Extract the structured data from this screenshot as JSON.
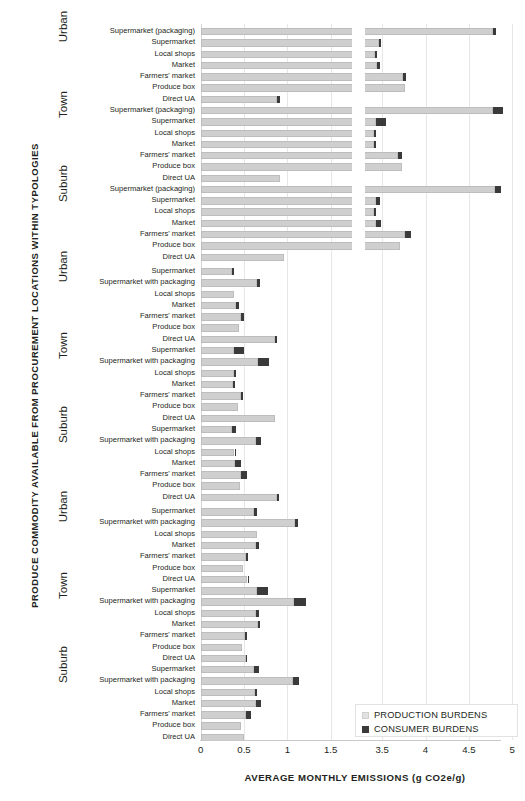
{
  "chart_data": {
    "type": "bar",
    "orientation": "horizontal",
    "title": "",
    "xlabel": "AVERAGE  MONTHLY  EMISSIONS (g CO2e/g)",
    "ylabel": "PRODUCE COMMODITY AVAILABLE FROM PROCUREMENT LOCATIONS WITHIN TYPOLOGIES",
    "grid": true,
    "legend_position": "bottom-right",
    "axis_break": {
      "from": 1.75,
      "to": 3.3
    },
    "xticks": [
      "0",
      "0.5",
      "1",
      "1.5",
      "3.5",
      "4",
      "4.5",
      "5"
    ],
    "xtick_values": [
      0,
      0.5,
      1,
      1.5,
      3.5,
      4,
      4.5,
      5
    ],
    "series": [
      {
        "name": "PRODUCTION BURDENS",
        "color": "#cfcfcf"
      },
      {
        "name": "CONSUMER BURDENS",
        "color": "#3a3a3a"
      }
    ],
    "groups": [
      {
        "commodity": "Tomato",
        "typologies": [
          {
            "name": "Urban",
            "rows": [
              {
                "label": "Supermarket (packaging)",
                "production": 4.78,
                "consumer": 0.03
              },
              {
                "label": "Supermarket",
                "production": 3.46,
                "consumer": 0.03
              },
              {
                "label": "Local shops",
                "production": 3.42,
                "consumer": 0.01
              },
              {
                "label": "Market",
                "production": 3.44,
                "consumer": 0.03
              },
              {
                "label": "Farmers' market",
                "production": 3.74,
                "consumer": 0.03
              },
              {
                "label": "Produce box",
                "production": 3.76,
                "consumer": 0.0
              },
              {
                "label": "Direct UA",
                "production": 0.88,
                "consumer": 0.03
              }
            ]
          },
          {
            "name": "Town",
            "rows": [
              {
                "label": "Supermarket (packaging)",
                "production": 4.78,
                "consumer": 0.12
              },
              {
                "label": "Supermarket",
                "production": 3.43,
                "consumer": 0.12
              },
              {
                "label": "Local shops",
                "production": 3.41,
                "consumer": 0.02
              },
              {
                "label": "Market",
                "production": 3.41,
                "consumer": 0.02
              },
              {
                "label": "Farmers' market",
                "production": 3.68,
                "consumer": 0.05
              },
              {
                "label": "Produce box",
                "production": 3.73,
                "consumer": 0.0
              },
              {
                "label": "Direct UA",
                "production": 0.92,
                "consumer": 0.0
              }
            ]
          },
          {
            "name": "Suburb",
            "rows": [
              {
                "label": "Supermarket (packaging)",
                "production": 4.8,
                "consumer": 0.07
              },
              {
                "label": "Supermarket",
                "production": 3.43,
                "consumer": 0.05
              },
              {
                "label": "Local shops",
                "production": 3.41,
                "consumer": 0.02
              },
              {
                "label": "Market",
                "production": 3.43,
                "consumer": 0.06
              },
              {
                "label": "Farmers' market",
                "production": 3.76,
                "consumer": 0.07
              },
              {
                "label": "Produce box",
                "production": 3.71,
                "consumer": 0.0
              },
              {
                "label": "Direct UA",
                "production": 0.96,
                "consumer": 0.0
              }
            ]
          }
        ]
      },
      {
        "commodity": "Potato",
        "typologies": [
          {
            "name": "Urban",
            "rows": [
              {
                "label": "Supermarket",
                "production": 0.36,
                "consumer": 0.03
              },
              {
                "label": "Supermarket with packaging",
                "production": 0.65,
                "consumer": 0.03
              },
              {
                "label": "Local shops",
                "production": 0.39,
                "consumer": 0.0
              },
              {
                "label": "Market",
                "production": 0.41,
                "consumer": 0.03
              },
              {
                "label": "Farmers' market",
                "production": 0.47,
                "consumer": 0.03
              },
              {
                "label": "Produce box",
                "production": 0.44,
                "consumer": 0.0
              },
              {
                "label": "Direct UA",
                "production": 0.86,
                "consumer": 0.02
              }
            ]
          },
          {
            "name": "Town",
            "rows": [
              {
                "label": "Supermarket",
                "production": 0.38,
                "consumer": 0.12
              },
              {
                "label": "Supermarket with packaging",
                "production": 0.66,
                "consumer": 0.13
              },
              {
                "label": "Local shops",
                "production": 0.38,
                "consumer": 0.03
              },
              {
                "label": "Market",
                "production": 0.37,
                "consumer": 0.03
              },
              {
                "label": "Farmers' market",
                "production": 0.46,
                "consumer": 0.03
              },
              {
                "label": "Produce box",
                "production": 0.43,
                "consumer": 0.0
              },
              {
                "label": "Direct UA",
                "production": 0.86,
                "consumer": 0.0
              }
            ]
          },
          {
            "name": "Suburb",
            "rows": [
              {
                "label": "Supermarket",
                "production": 0.36,
                "consumer": 0.05
              },
              {
                "label": "Supermarket with packaging",
                "production": 0.64,
                "consumer": 0.06
              },
              {
                "label": "Local shops",
                "production": 0.39,
                "consumer": 0.02
              },
              {
                "label": "Market",
                "production": 0.4,
                "consumer": 0.06
              },
              {
                "label": "Farmers' market",
                "production": 0.47,
                "consumer": 0.06
              },
              {
                "label": "Produce box",
                "production": 0.45,
                "consumer": 0.0
              },
              {
                "label": "Direct UA",
                "production": 0.88,
                "consumer": 0.02
              }
            ]
          }
        ]
      },
      {
        "commodity": "Apple",
        "typologies": [
          {
            "name": "Urban",
            "rows": [
              {
                "label": "Supermarket",
                "production": 0.62,
                "consumer": 0.03
              },
              {
                "label": "Supermarket with packaging",
                "production": 1.09,
                "consumer": 0.03
              },
              {
                "label": "Local shops",
                "production": 0.65,
                "consumer": 0.0
              },
              {
                "label": "Market",
                "production": 0.64,
                "consumer": 0.03
              },
              {
                "label": "Farmers' market",
                "production": 0.52,
                "consumer": 0.03
              },
              {
                "label": "Produce box",
                "production": 0.49,
                "consumer": 0.0
              },
              {
                "label": "Direct UA",
                "production": 0.54,
                "consumer": 0.02
              }
            ]
          },
          {
            "name": "Town",
            "rows": [
              {
                "label": "Supermarket",
                "production": 0.65,
                "consumer": 0.13
              },
              {
                "label": "Supermarket with packaging",
                "production": 1.08,
                "consumer": 0.14
              },
              {
                "label": "Local shops",
                "production": 0.64,
                "consumer": 0.03
              },
              {
                "label": "Market",
                "production": 0.66,
                "consumer": 0.03
              },
              {
                "label": "Farmers' market",
                "production": 0.51,
                "consumer": 0.03
              },
              {
                "label": "Produce box",
                "production": 0.48,
                "consumer": 0.0
              },
              {
                "label": "Direct UA",
                "production": 0.52,
                "consumer": 0.01
              }
            ]
          },
          {
            "name": "Suburb",
            "rows": [
              {
                "label": "Supermarket",
                "production": 0.61,
                "consumer": 0.06
              },
              {
                "label": "Supermarket with packaging",
                "production": 1.07,
                "consumer": 0.07
              },
              {
                "label": "Local shops",
                "production": 0.63,
                "consumer": 0.02
              },
              {
                "label": "Market",
                "production": 0.64,
                "consumer": 0.06
              },
              {
                "label": "Farmers' market",
                "production": 0.52,
                "consumer": 0.06
              },
              {
                "label": "Produce box",
                "production": 0.47,
                "consumer": 0.0
              },
              {
                "label": "Direct UA",
                "production": 0.5,
                "consumer": 0.0
              }
            ]
          }
        ]
      }
    ]
  }
}
